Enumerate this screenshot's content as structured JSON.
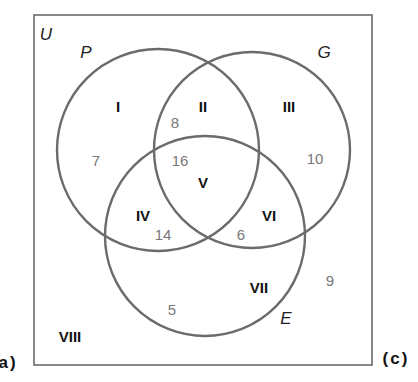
{
  "diagram": {
    "type": "venn-3",
    "universe": {
      "label": "U"
    },
    "sets": [
      {
        "id": "P",
        "label": "P"
      },
      {
        "id": "G",
        "label": "G"
      },
      {
        "id": "E",
        "label": "E"
      }
    ],
    "regions": [
      {
        "roman": "I",
        "description": "P only",
        "count": "7"
      },
      {
        "roman": "II",
        "description": "P and G only",
        "count": "8"
      },
      {
        "roman": "III",
        "description": "G only",
        "count": "10"
      },
      {
        "roman": "IV",
        "description": "P and E only",
        "count": "14"
      },
      {
        "roman": "V",
        "description": "P, G and E",
        "count": "16"
      },
      {
        "roman": "VI",
        "description": "G and E only",
        "count": "6"
      },
      {
        "roman": "VII",
        "description": "E only",
        "count": "5"
      },
      {
        "roman": "VIII",
        "description": "outside P, G, E",
        "count": "9"
      }
    ],
    "side_labels": {
      "left": "a)",
      "right": "(c)"
    },
    "colors": {
      "outline": "#6b6b6b",
      "region_label": "#111111",
      "count": "#777777"
    }
  }
}
